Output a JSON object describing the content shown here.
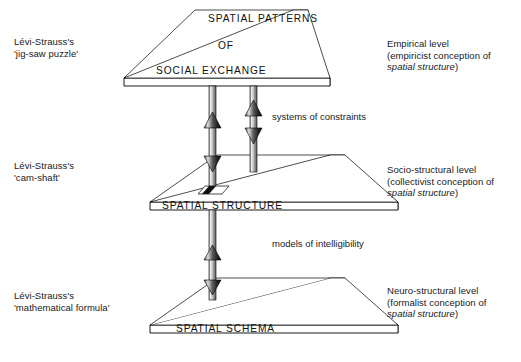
{
  "diagram": {
    "title_levels": [
      {
        "id": "empirical",
        "plane_lines": [
          "SPATIAL PATTERNS",
          "OF",
          "SOCIAL EXCHANGE"
        ],
        "left_label_lines": [
          "Lévi-Strauss's",
          "'jig-saw puzzle'"
        ],
        "right_label_line1": "Empirical level",
        "right_label_line2": "(empiricist conception of",
        "right_label_italic": "spatial structure",
        "right_label_close": ")"
      },
      {
        "id": "socio-structural",
        "plane_lines": [
          "SPATIAL STRUCTURE"
        ],
        "left_label_lines": [
          "Lévi-Strauss's",
          "'cam-shaft'"
        ],
        "right_label_line1": "Socio-structural level",
        "right_label_line2": "(collectivist conception of",
        "right_label_italic": "spatial structure",
        "right_label_close": ")"
      },
      {
        "id": "neuro-structural",
        "plane_lines": [
          "SPATIAL SCHEMA"
        ],
        "left_label_lines": [
          "Lévi-Strauss's",
          "'mathematical formula'"
        ],
        "right_label_line1": "Neuro-structural level",
        "right_label_line2": "(formalist conception of",
        "right_label_italic": "spatial structure",
        "right_label_close": ")"
      }
    ],
    "connectors": [
      {
        "id": "upper",
        "label": "systems of constraints"
      },
      {
        "id": "lower",
        "label": "models of intelligibility"
      }
    ],
    "colors": {
      "plane_face": "#ffffff",
      "plane_outline": "#000000",
      "plane_edge_shade": "#7d7d7d",
      "shaft_light": "#e2e2e2",
      "shaft_dark": "#6f6f6f",
      "arrow_dark": "#1a1a1a",
      "text": "#202020"
    }
  }
}
